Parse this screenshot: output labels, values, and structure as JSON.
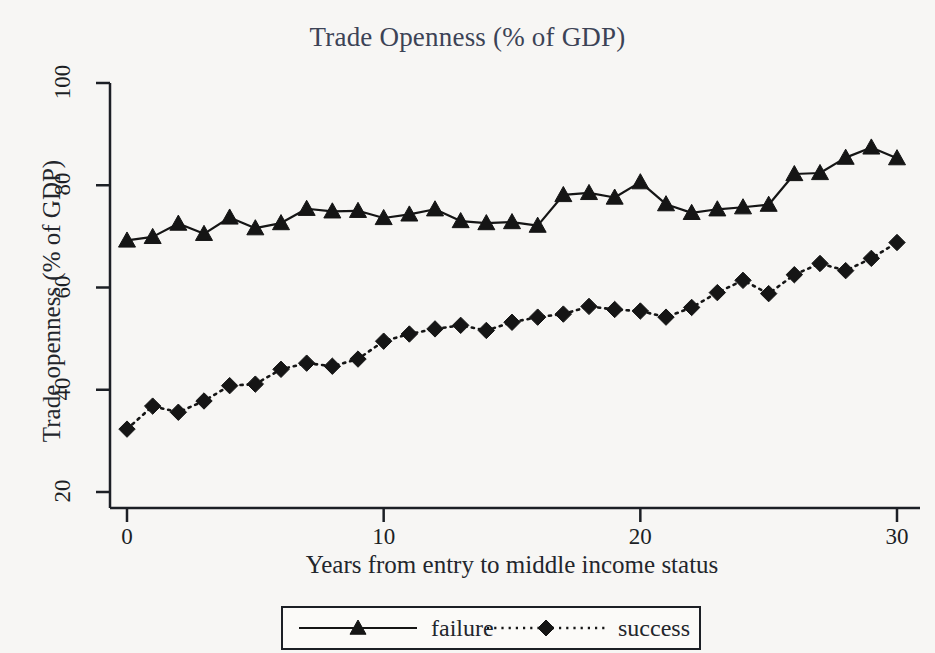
{
  "chart_data": {
    "type": "line",
    "title": "Trade Openness (% of GDP)",
    "xlabel": "Years from entry to middle income status",
    "ylabel": "Trade openness (% of GDP)",
    "xlim": [
      -0.8,
      30.8
    ],
    "ylim": [
      16,
      103
    ],
    "grid": false,
    "legend_position": "below-axis",
    "xticks": [
      0,
      10,
      20,
      30
    ],
    "yticks": [
      20,
      40,
      60,
      80,
      100
    ],
    "x": [
      0,
      1,
      2,
      3,
      4,
      5,
      6,
      7,
      8,
      9,
      10,
      11,
      12,
      13,
      14,
      15,
      16,
      17,
      18,
      19,
      20,
      21,
      22,
      23,
      24,
      25,
      26,
      27,
      28,
      29,
      30
    ],
    "series": [
      {
        "name": "failure",
        "marker": "triangle",
        "line_style": "solid",
        "color": "#151515",
        "values": [
          69.2,
          69.9,
          72.5,
          70.5,
          73.7,
          71.6,
          72.6,
          75.4,
          74.9,
          75.0,
          73.6,
          74.3,
          75.3,
          73.0,
          72.6,
          72.8,
          72.1,
          78.1,
          78.5,
          77.6,
          80.6,
          76.3,
          74.6,
          75.3,
          75.7,
          76.2,
          82.2,
          82.4,
          85.4,
          87.4,
          85.3
        ]
      },
      {
        "name": "success",
        "marker": "diamond",
        "line_style": "dotted",
        "color": "#151515",
        "values": [
          32.3,
          36.8,
          35.6,
          37.8,
          40.8,
          41.1,
          44.0,
          45.2,
          44.6,
          46.0,
          49.5,
          50.9,
          51.9,
          52.6,
          51.6,
          53.2,
          54.2,
          54.8,
          56.3,
          55.7,
          55.4,
          54.2,
          56.1,
          59.0,
          61.4,
          58.8,
          62.5,
          64.7,
          63.3,
          65.7,
          68.8
        ]
      }
    ],
    "legend": [
      {
        "label": "failure",
        "marker": "triangle",
        "line_style": "solid"
      },
      {
        "label": "success",
        "marker": "diamond",
        "line_style": "dotted"
      }
    ]
  },
  "colors": {
    "title": "#3c4356",
    "axis": "#1c1f25",
    "series": "#151515",
    "background": "#f7f6f4"
  }
}
